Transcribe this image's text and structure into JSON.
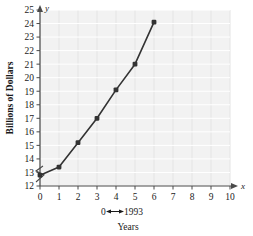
{
  "chart_data": {
    "type": "line",
    "title": "",
    "xlabel": "Years",
    "ylabel": "Billions of Dollars",
    "x": [
      0,
      1,
      2,
      3,
      4,
      5,
      6
    ],
    "values": [
      12.8,
      13.4,
      15.2,
      17.0,
      19.1,
      21.0,
      24.1
    ],
    "series": [
      {
        "name": "",
        "values": [
          12.8,
          13.4,
          15.2,
          17.0,
          19.1,
          21.0,
          24.1
        ]
      }
    ],
    "xlim": [
      0,
      10
    ],
    "ylim": [
      12,
      25
    ],
    "xticks": [
      "0",
      "1",
      "2",
      "3",
      "4",
      "5",
      "6",
      "7",
      "8",
      "9",
      "10"
    ],
    "yticks": [
      "12",
      "13",
      "14",
      "15",
      "16",
      "17",
      "18",
      "19",
      "20",
      "21",
      "22",
      "23",
      "24",
      "25"
    ],
    "grid": true,
    "legend": "none",
    "y_axis_break": true,
    "annotation": "0↔ 1993",
    "annotation_from": "0",
    "annotation_to": "1993",
    "x_axis_variable": "x",
    "y_axis_variable": "y",
    "marker_color": "#333333",
    "line_color": "#333333",
    "grid_color": "#e4e4e4",
    "plot_background": "#f2f2f2",
    "axis_color": "#4a4a4a"
  }
}
